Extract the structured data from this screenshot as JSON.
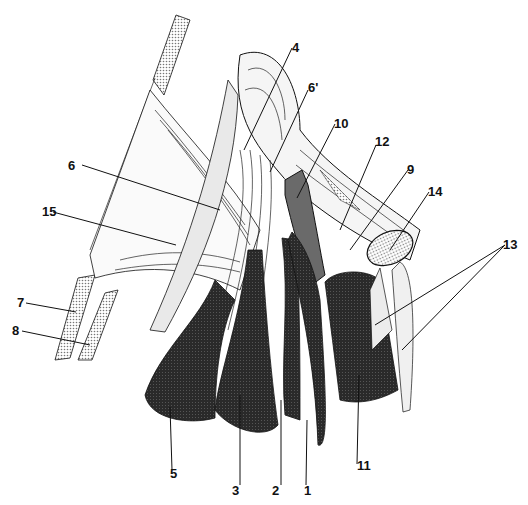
{
  "figure": {
    "type": "anatomical line illustration",
    "colors": {
      "background": "#ffffff",
      "ink": "#111111",
      "dark_muscle": "#2b2b2b",
      "mid_gray": "#6a6a6a",
      "light_gray": "#e6e6e6",
      "stipple": "#bdbdbd"
    }
  },
  "labels": [
    {
      "id": "1",
      "text": "1"
    },
    {
      "id": "2",
      "text": "2"
    },
    {
      "id": "3",
      "text": "3"
    },
    {
      "id": "4",
      "text": "4"
    },
    {
      "id": "5",
      "text": "5"
    },
    {
      "id": "6",
      "text": "6"
    },
    {
      "id": "6p",
      "text": "6'"
    },
    {
      "id": "7",
      "text": "7"
    },
    {
      "id": "8",
      "text": "8"
    },
    {
      "id": "9",
      "text": "9"
    },
    {
      "id": "10",
      "text": "10"
    },
    {
      "id": "11",
      "text": "11"
    },
    {
      "id": "12",
      "text": "12"
    },
    {
      "id": "13",
      "text": "13"
    },
    {
      "id": "14",
      "text": "14"
    },
    {
      "id": "15",
      "text": "15"
    }
  ]
}
